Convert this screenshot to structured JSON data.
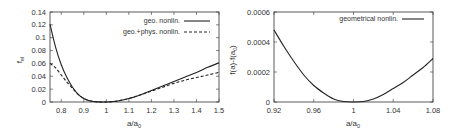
{
  "chart_data": [
    {
      "type": "line",
      "title": "",
      "xlabel": "a/a_0",
      "ylabel": "f_el",
      "xlim": [
        0.75,
        1.5
      ],
      "ylim": [
        0,
        0.14
      ],
      "xticks": [
        "0.8",
        "0.9",
        "1",
        "1.1",
        "1.2",
        "1.3",
        "1.4",
        "1.5"
      ],
      "yticks": [
        "0",
        "0.02",
        "0.04",
        "0.06",
        "0.08",
        "0.1",
        "0.12",
        "0.14"
      ],
      "grid": false,
      "legend_position": "top-right",
      "x": [
        0.75,
        0.775,
        0.8,
        0.825,
        0.85,
        0.875,
        0.9,
        0.925,
        0.95,
        0.975,
        1.0,
        1.05,
        1.1,
        1.15,
        1.2,
        1.25,
        1.3,
        1.35,
        1.4,
        1.45,
        1.5
      ],
      "series": [
        {
          "name": "geo. nonlin.",
          "style": "solid",
          "values": [
            0.121,
            0.085,
            0.058,
            0.038,
            0.023,
            0.012,
            0.0055,
            0.002,
            0.0004,
            0.0001,
            0.0,
            0.0015,
            0.0055,
            0.011,
            0.018,
            0.025,
            0.032,
            0.039,
            0.046,
            0.054,
            0.061
          ]
        },
        {
          "name": "geo.+phys. nonlin.",
          "style": "dashed",
          "values": [
            0.06,
            0.053,
            0.042,
            0.031,
            0.021,
            0.012,
            0.0055,
            0.002,
            0.0004,
            0.0001,
            0.0,
            0.0015,
            0.0055,
            0.011,
            0.017,
            0.023,
            0.029,
            0.034,
            0.038,
            0.042,
            0.046
          ]
        }
      ]
    },
    {
      "type": "line",
      "title": "",
      "xlabel": "a/a_0",
      "ylabel": "f(a)-f(a_0)",
      "xlim": [
        0.92,
        1.08
      ],
      "ylim": [
        0,
        0.0006
      ],
      "xticks": [
        "0.92",
        "0.96",
        "1",
        "1.04",
        "1.08"
      ],
      "yticks": [
        "0",
        "0.0002",
        "0.0004",
        "0.0006"
      ],
      "grid": false,
      "legend_position": "top-right",
      "x": [
        0.92,
        0.93,
        0.94,
        0.95,
        0.96,
        0.97,
        0.98,
        0.99,
        1.0,
        1.01,
        1.02,
        1.03,
        1.04,
        1.05,
        1.06,
        1.07,
        1.08
      ],
      "series": [
        {
          "name": "geometrical nonlin.",
          "style": "solid",
          "values": [
            0.00048,
            0.00037,
            0.00027,
            0.00018,
            0.00011,
            6e-05,
            2e-05,
            3e-06,
            0.0,
            3e-06,
            2e-05,
            5e-05,
            9e-05,
            0.00013,
            0.00018,
            0.00023,
            0.00029
          ]
        }
      ]
    }
  ],
  "plots": [
    {
      "xlabel": "a/a",
      "xlabel_sub": "0",
      "ylabel": "f",
      "ylabel_sub": "el",
      "legend": [
        {
          "label": "geo. nonlin."
        },
        {
          "label": "geo.+phys. nonlin."
        }
      ]
    },
    {
      "xlabel": "a/a",
      "xlabel_sub": "0",
      "ylabel": "f(a)-f(a",
      "ylabel_sub": "0",
      "ylabel_end": ")",
      "legend": [
        {
          "label": "geometrical nonlin."
        }
      ]
    }
  ]
}
